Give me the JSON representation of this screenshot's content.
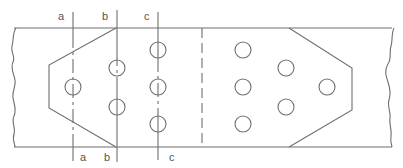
{
  "diagram": {
    "section_labels": {
      "top": [
        "a",
        "b",
        "c"
      ],
      "bottom": [
        "a",
        "b",
        "c"
      ]
    },
    "section_lines": [
      {
        "id": "a",
        "label": "a"
      },
      {
        "id": "b",
        "label": "b"
      },
      {
        "id": "c",
        "label": "c"
      }
    ],
    "holes_left_group_count": 6,
    "holes_right_group_count": 6,
    "colors": {
      "line": "#6e6e6e",
      "text": "#555555",
      "background": "#ffffff"
    }
  }
}
